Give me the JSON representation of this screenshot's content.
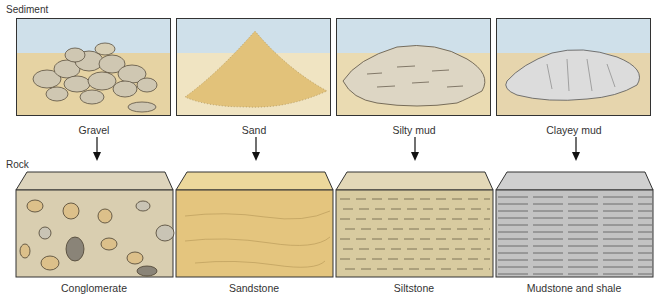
{
  "diagram": {
    "row_labels": {
      "sediment": "Sediment",
      "rock": "Rock"
    },
    "columns": [
      {
        "sediment": "Gravel",
        "rock": "Conglomerate"
      },
      {
        "sediment": "Sand",
        "rock": "Sandstone"
      },
      {
        "sediment": "Silty mud",
        "rock": "Siltstone"
      },
      {
        "sediment": "Clayey mud",
        "rock": "Mudstone and shale"
      }
    ],
    "colors": {
      "sky": "#cfe0ea",
      "ground": "#e9d6a8",
      "sand": "#e2c27a",
      "silt": "#d8cba4",
      "clay": "#b9b9b9",
      "gravel_matrix": "#d9ceb0",
      "outline": "#333333"
    }
  }
}
